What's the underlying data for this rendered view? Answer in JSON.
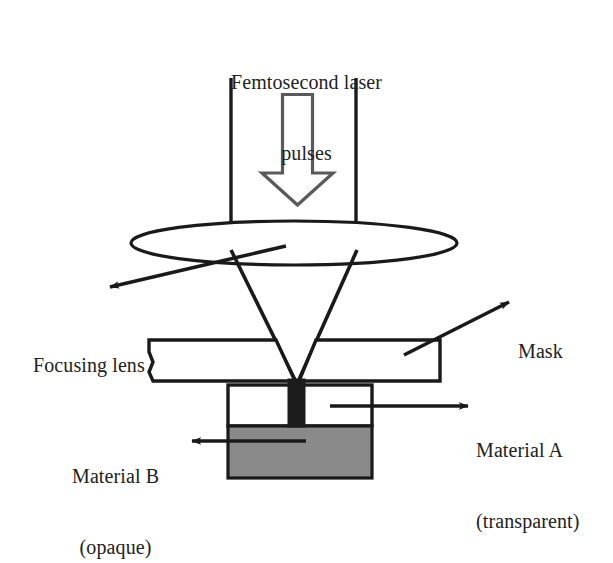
{
  "figure": {
    "kind": "optical-schematic",
    "background_color": "#ffffff",
    "stroke_color": "#1a1a1a"
  },
  "labels": {
    "source_line1": "Femtosecond laser",
    "source_line2": "pulses",
    "focusing_lens": "Focusing lens",
    "mask": "Mask",
    "material_a_line1": "Material A",
    "material_a_line2": "(transparent)",
    "material_b_line1": "Material B",
    "material_b_line2": "(opaque)"
  },
  "components": {
    "beam_guide_left": "beam-boundary-left",
    "beam_guide_right": "beam-boundary-right",
    "propagation_arrow": "hollow-down-arrow",
    "lens": "focusing-lens-ellipse",
    "converging_cone": "converging-beam-cone",
    "mask_plate": "mask-plate",
    "transparent_layer": "material-a-transparent-layer",
    "opaque_layer": "material-b-opaque-layer",
    "drilled_channel": "laser-drilled-channel"
  },
  "colors": {
    "outline": "#1a1a1a",
    "opaque_material_fill": "#8a8a8a",
    "transparent_material_fill": "#ffffff",
    "channel_fill": "#1c1c1c",
    "page": "#ffffff"
  },
  "geometry": {
    "beam_left_x": 231,
    "beam_right_x": 356,
    "beam_top_y": 78,
    "lens_center": [
      294,
      243
    ],
    "lens_rx": 163,
    "lens_ry": 22,
    "focal_point": [
      297,
      383
    ],
    "mask_rect": [
      148,
      338,
      292,
      44
    ],
    "material_a_rect": [
      228,
      385,
      144,
      41
    ],
    "material_b_rect": [
      228,
      426,
      144,
      52
    ],
    "channel_rect": [
      288,
      381,
      17,
      45
    ]
  }
}
